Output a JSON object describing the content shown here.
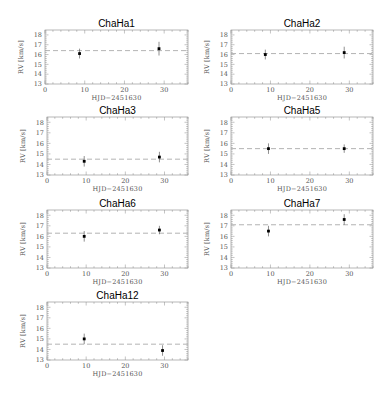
{
  "figure": {
    "xlabel": "HJD−2451630",
    "ylabel": "RV [km/s]",
    "x_ticks": [
      0,
      10,
      20,
      30
    ],
    "y_ticks": [
      13,
      14,
      15,
      16,
      17,
      18
    ],
    "xlim": [
      0,
      36
    ],
    "ylim": [
      13,
      18.5
    ],
    "colors": {
      "frame": "#888888",
      "data": "#000000",
      "dashed": "#aaaaaa",
      "text": "#555555"
    }
  },
  "chart_data": [
    {
      "type": "scatter",
      "title": "ChaHa1",
      "xlabel": "HJD−2451630",
      "ylabel": "RV [km/s]",
      "xlim": [
        0,
        36
      ],
      "ylim": [
        13,
        18.5
      ],
      "mean_rv": 16.4,
      "points": [
        {
          "x": 8.7,
          "y": 16.1,
          "err": 0.5
        },
        {
          "x": 28.7,
          "y": 16.6,
          "err": 0.7
        }
      ]
    },
    {
      "type": "scatter",
      "title": "ChaHa2",
      "xlabel": "HJD−2451630",
      "ylabel": "RV [km/s]",
      "xlim": [
        0,
        36
      ],
      "ylim": [
        13,
        18.5
      ],
      "mean_rv": 16.1,
      "points": [
        {
          "x": 8.7,
          "y": 16.0,
          "err": 0.5
        },
        {
          "x": 28.7,
          "y": 16.2,
          "err": 0.6
        }
      ]
    },
    {
      "type": "scatter",
      "title": "ChaHa3",
      "xlabel": "HJD−2451630",
      "ylabel": "RV [km/s]",
      "xlim": [
        0,
        36
      ],
      "ylim": [
        13,
        18.5
      ],
      "mean_rv": 14.5,
      "points": [
        {
          "x": 9.5,
          "y": 14.3,
          "err": 0.5
        },
        {
          "x": 28.7,
          "y": 14.7,
          "err": 0.5
        }
      ]
    },
    {
      "type": "scatter",
      "title": "ChaHa5",
      "xlabel": "HJD−2451630",
      "ylabel": "RV [km/s]",
      "xlim": [
        0,
        36
      ],
      "ylim": [
        13,
        18.5
      ],
      "mean_rv": 15.5,
      "points": [
        {
          "x": 9.5,
          "y": 15.5,
          "err": 0.5
        },
        {
          "x": 28.7,
          "y": 15.5,
          "err": 0.4
        }
      ]
    },
    {
      "type": "scatter",
      "title": "ChaHa6",
      "xlabel": "HJD−2451630",
      "ylabel": "RV [km/s]",
      "xlim": [
        0,
        36
      ],
      "ylim": [
        13,
        18.5
      ],
      "mean_rv": 16.3,
      "points": [
        {
          "x": 9.5,
          "y": 16.0,
          "err": 0.5
        },
        {
          "x": 28.7,
          "y": 16.6,
          "err": 0.4
        }
      ]
    },
    {
      "type": "scatter",
      "title": "ChaHa7",
      "xlabel": "HJD−2451630",
      "ylabel": "RV [km/s]",
      "xlim": [
        0,
        36
      ],
      "ylim": [
        13,
        18.5
      ],
      "mean_rv": 17.1,
      "points": [
        {
          "x": 9.5,
          "y": 16.5,
          "err": 0.5
        },
        {
          "x": 28.7,
          "y": 17.6,
          "err": 0.5
        }
      ]
    },
    {
      "type": "scatter",
      "title": "ChaHa12",
      "xlabel": "HJD−2451630",
      "ylabel": "RV [km/s]",
      "xlim": [
        0,
        36
      ],
      "ylim": [
        13,
        18.5
      ],
      "mean_rv": 14.5,
      "points": [
        {
          "x": 9.5,
          "y": 15.0,
          "err": 0.5
        },
        {
          "x": 29.5,
          "y": 13.9,
          "err": 0.5
        }
      ]
    }
  ],
  "layout": {
    "panels": [
      {
        "left": 45,
        "top": 30,
        "width": 143,
        "height": 54
      },
      {
        "left": 231,
        "top": 30,
        "width": 142,
        "height": 54
      },
      {
        "left": 47,
        "top": 117,
        "width": 141,
        "height": 58
      },
      {
        "left": 231,
        "top": 117,
        "width": 142,
        "height": 58
      },
      {
        "left": 47,
        "top": 210,
        "width": 141,
        "height": 58
      },
      {
        "left": 231,
        "top": 210,
        "width": 142,
        "height": 58
      },
      {
        "left": 47,
        "top": 302,
        "width": 141,
        "height": 58
      }
    ]
  }
}
